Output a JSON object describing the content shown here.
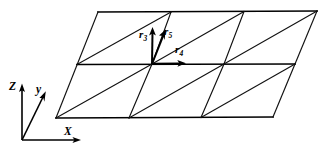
{
  "figure": {
    "background_color": "#ffffff",
    "line_color": "#111111",
    "vector_color": "#000000",
    "width": 329,
    "height": 151
  },
  "vectors": {
    "r3": {
      "label": "r",
      "subscript": "3",
      "direction": "up",
      "origin_node": "center"
    },
    "r4": {
      "label": "r",
      "subscript": "4",
      "direction": "right",
      "origin_node": "center"
    },
    "r5": {
      "label": "r",
      "subscript": "5",
      "direction": "up-right-diagonal",
      "origin_node": "center"
    }
  },
  "axes": {
    "z": {
      "label": "Z",
      "direction": "up"
    },
    "y": {
      "label": "y",
      "direction": "up-right-diagonal"
    },
    "x": {
      "label": "X",
      "direction": "right"
    }
  },
  "mesh": {
    "columns": 3,
    "rows": 2,
    "cell_type": "parallelogram-split-by-diagonal",
    "diagonal_direction": "bottom-left-to-top-right",
    "top_left": [
      98,
      12
    ],
    "top_right": [
      317,
      11
    ],
    "bottom_left": [
      56,
      118
    ],
    "bottom_right": [
      273,
      117
    ],
    "middle_left": [
      77,
      64
    ],
    "middle_right": [
      295,
      64
    ],
    "center_node": [
      152,
      64
    ]
  }
}
